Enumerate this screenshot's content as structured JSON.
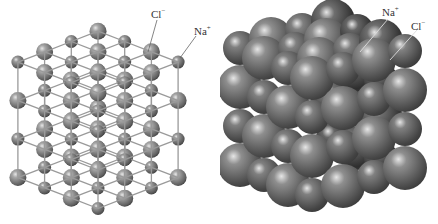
{
  "figure": {
    "left_model": {
      "type": "ball-and-stick",
      "atoms_per_edge": 4,
      "labels": [
        {
          "id": "cl",
          "base": "Cl",
          "charge": "−"
        },
        {
          "id": "na",
          "base": "Na",
          "charge": "+"
        }
      ]
    },
    "right_model": {
      "type": "space-filling",
      "atoms_per_edge": 4,
      "labels": [
        {
          "id": "na",
          "base": "Na",
          "charge": "+"
        },
        {
          "id": "cl",
          "base": "Cl",
          "charge": "−"
        }
      ]
    },
    "colors": {
      "cl_fill": "#8a8a8a",
      "na_fill": "#7a7a7a",
      "bond": "#9a9a9a",
      "leader_line": "#666666",
      "text": "#333333"
    }
  }
}
